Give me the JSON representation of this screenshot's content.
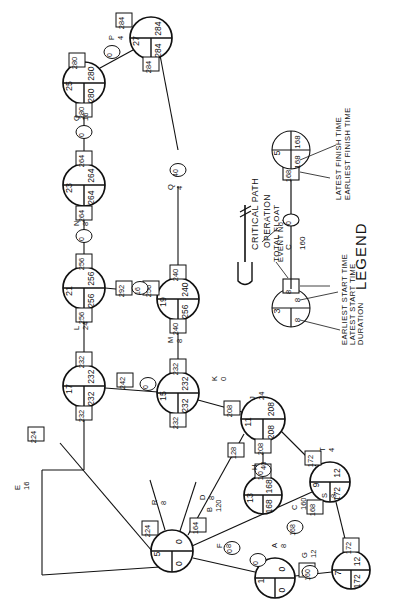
{
  "legend": {
    "heading": "LEGEND",
    "items": [
      {
        "key": "critical-path",
        "label": "CRITICAL PATH"
      },
      {
        "key": "operation",
        "label": "OPERATION"
      },
      {
        "key": "total-float",
        "label": "TOTAL FLOAT"
      },
      {
        "key": "event-no",
        "label": "EVENT No."
      },
      {
        "key": "earliest-start",
        "label": "EARLIEST START TIME"
      },
      {
        "key": "latest-start",
        "label": "LATEST START TIME"
      },
      {
        "key": "duration",
        "label": "DURATION"
      },
      {
        "key": "latest-finish",
        "label": "LATEST FINISH TIME"
      },
      {
        "key": "earliest-finish",
        "label": "EARLIEST FINISH TIME"
      }
    ],
    "sample_nodes": [
      {
        "id": "3",
        "earliest": "8",
        "latest": "8"
      },
      {
        "id": "5",
        "earliest": "168",
        "latest": "168"
      }
    ],
    "sample_edge": {
      "name": "C",
      "duration": "160",
      "float_left": "8",
      "float_right": "168"
    }
  },
  "nodes": [
    {
      "id": "27",
      "earliest": "284",
      "latest": "284",
      "x": 151,
      "y": 38,
      "r": 21
    },
    {
      "id": "25",
      "earliest": "280",
      "latest": "280",
      "x": 84,
      "y": 83,
      "r": 21
    },
    {
      "id": "23",
      "earliest": "264",
      "latest": "264",
      "x": 84,
      "y": 185,
      "r": 21
    },
    {
      "id": "21",
      "earliest": "256",
      "latest": "256",
      "x": 84,
      "y": 288,
      "r": 21
    },
    {
      "id": "19",
      "earliest": "240",
      "latest": "256",
      "x": 178,
      "y": 299,
      "r": 21
    },
    {
      "id": "17",
      "earliest": "232",
      "latest": "232",
      "x": 84,
      "y": 386,
      "r": 21
    },
    {
      "id": "15",
      "earliest": "232",
      "latest": "232",
      "x": 178,
      "y": 393,
      "r": 21
    },
    {
      "id": "11",
      "earliest": "208",
      "latest": "208",
      "x": 263,
      "y": 419,
      "r": 22
    },
    {
      "id": "13",
      "earliest": "168",
      "latest": "168",
      "x": 263,
      "y": 495,
      "r": 19
    },
    {
      "id": "9",
      "earliest": "12",
      "latest": "172",
      "x": 330,
      "y": 482,
      "r": 20
    },
    {
      "id": "7",
      "earliest": "12",
      "latest": "172",
      "x": 351,
      "y": 570,
      "r": 19
    },
    {
      "id": "5",
      "earliest": "0",
      "latest": "0",
      "x": 172,
      "y": 551,
      "r": 21
    },
    {
      "id": "1",
      "earliest": "0",
      "latest": "0",
      "x": 275,
      "y": 578,
      "r": 20
    }
  ],
  "float_boxes": [
    {
      "value": "284",
      "x": 151,
      "y": 64
    },
    {
      "value": "284",
      "x": 124,
      "y": 20
    },
    {
      "value": "280",
      "x": 84,
      "y": 110
    },
    {
      "value": "280",
      "x": 77,
      "y": 60
    },
    {
      "value": "264",
      "x": 84,
      "y": 213
    },
    {
      "value": "264",
      "x": 84,
      "y": 158
    },
    {
      "value": "256",
      "x": 84,
      "y": 315
    },
    {
      "value": "256",
      "x": 84,
      "y": 261
    },
    {
      "value": "240",
      "x": 178,
      "y": 272
    },
    {
      "value": "240",
      "x": 178,
      "y": 326
    },
    {
      "value": "232",
      "x": 84,
      "y": 413
    },
    {
      "value": "232",
      "x": 84,
      "y": 359
    },
    {
      "value": "232",
      "x": 178,
      "y": 366
    },
    {
      "value": "232",
      "x": 178,
      "y": 420
    },
    {
      "value": "242",
      "x": 125,
      "y": 380
    },
    {
      "value": "208",
      "x": 232,
      "y": 408
    },
    {
      "value": "208",
      "x": 263,
      "y": 446
    },
    {
      "value": "224",
      "x": 36,
      "y": 434
    },
    {
      "value": "168",
      "x": 263,
      "y": 471
    },
    {
      "value": "168",
      "x": 315,
      "y": 507
    },
    {
      "value": "172",
      "x": 313,
      "y": 458
    },
    {
      "value": "172",
      "x": 351,
      "y": 545
    },
    {
      "value": "224",
      "x": 150,
      "y": 528
    },
    {
      "value": "164",
      "x": 198,
      "y": 525
    },
    {
      "value": "128",
      "x": 236,
      "y": 450
    },
    {
      "value": "12",
      "x": 307,
      "y": 570
    },
    {
      "value": "292",
      "x": 124,
      "y": 288
    },
    {
      "value": "256",
      "x": 151,
      "y": 288
    }
  ],
  "ovals": [
    {
      "value": "0",
      "x": 112,
      "y": 52
    },
    {
      "value": "0",
      "x": 84,
      "y": 132
    },
    {
      "value": "0",
      "x": 84,
      "y": 236
    },
    {
      "value": "16",
      "x": 140,
      "y": 288
    },
    {
      "value": "40",
      "x": 178,
      "y": 170
    },
    {
      "value": "0",
      "x": 148,
      "y": 384
    },
    {
      "value": "0",
      "x": 263,
      "y": 470
    },
    {
      "value": "0",
      "x": 232,
      "y": 548
    },
    {
      "value": "0",
      "x": 258,
      "y": 560
    },
    {
      "value": "160",
      "x": 310,
      "y": 572
    },
    {
      "value": "168",
      "x": 295,
      "y": 527
    }
  ],
  "edge_labels": [
    {
      "name": "P",
      "dur": "4",
      "x": 107,
      "y": 40
    },
    {
      "name": "O",
      "dur": "16",
      "x": 72,
      "y": 121
    },
    {
      "name": "N",
      "dur": "8",
      "x": 72,
      "y": 226
    },
    {
      "name": "L",
      "dur": "24",
      "x": 72,
      "y": 330
    },
    {
      "name": "M",
      "dur": "8",
      "x": 166,
      "y": 343
    },
    {
      "name": "Q",
      "dur": "4",
      "x": 166,
      "y": 190
    },
    {
      "name": "K",
      "dur": "0",
      "x": 210,
      "y": 381
    },
    {
      "name": "J",
      "dur": "24",
      "x": 248,
      "y": 400
    },
    {
      "name": "H",
      "dur": "40",
      "x": 250,
      "y": 470
    },
    {
      "name": "E",
      "dur": "16",
      "x": 13,
      "y": 490
    },
    {
      "name": "D",
      "dur": "8",
      "x": 198,
      "y": 500
    },
    {
      "name": "F",
      "dur": "8",
      "x": 215,
      "y": 548
    },
    {
      "name": "G",
      "dur": "12",
      "x": 300,
      "y": 558
    },
    {
      "name": "A",
      "dur": "8",
      "x": 270,
      "y": 548
    },
    {
      "name": "C",
      "dur": "160",
      "x": 290,
      "y": 510
    },
    {
      "name": "B",
      "dur": "120",
      "x": 205,
      "y": 512
    },
    {
      "name": "R",
      "dur": "8",
      "x": 150,
      "y": 505
    },
    {
      "name": "S",
      "dur": "8",
      "x": 320,
      "y": 498
    },
    {
      "name": "T",
      "dur": "4",
      "x": 318,
      "y": 452
    }
  ]
}
